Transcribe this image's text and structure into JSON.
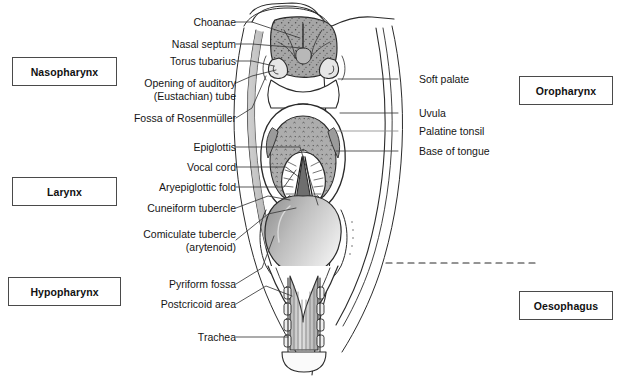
{
  "figure": {
    "colors": {
      "outline": "#2b2b2b",
      "mucosa_mid": "#9a9a9a",
      "mucosa_light": "#d9d9d9",
      "tongue_fill": "#b0b0b0",
      "epiglottis_fill": "#c8c8c8",
      "glottis_dark": "#6e6e6e",
      "trachea_fill": "#cfcfcf",
      "box_border": "#4a4a4a",
      "leader_line": "#3a3a3a",
      "background": "#ffffff"
    }
  },
  "region_boxes": [
    {
      "id": "nasopharynx",
      "label": "Nasopharynx",
      "side": "left"
    },
    {
      "id": "larynx",
      "label": "Larynx",
      "side": "left"
    },
    {
      "id": "hypopharynx",
      "label": "Hypopharynx",
      "side": "left"
    },
    {
      "id": "oropharynx",
      "label": "Oropharynx",
      "side": "right"
    },
    {
      "id": "oesophagus",
      "label": "Oesophagus",
      "side": "right"
    }
  ],
  "left_labels": [
    {
      "id": "choanae",
      "line1": "Choanae",
      "line2": ""
    },
    {
      "id": "nasal-septum",
      "line1": "Nasal septum",
      "line2": ""
    },
    {
      "id": "torus-tubarius",
      "line1": "Torus tubarius",
      "line2": ""
    },
    {
      "id": "auditory-tube",
      "line1": "Opening of auditory",
      "line2": "(Eustachian) tube"
    },
    {
      "id": "fossa-rosenmuller",
      "line1": "Fossa of Rosenmüller",
      "line2": ""
    },
    {
      "id": "epiglottis",
      "line1": "Epiglottis",
      "line2": ""
    },
    {
      "id": "vocal-cord",
      "line1": "Vocal cord",
      "line2": ""
    },
    {
      "id": "aryepiglottic-fold",
      "line1": "Aryepiglottic fold",
      "line2": ""
    },
    {
      "id": "cuneiform-tubercle",
      "line1": "Cuneiform tubercle",
      "line2": ""
    },
    {
      "id": "corniculate-tubercle",
      "line1": "Comiculate tubercle",
      "line2": "(arytenoid)"
    },
    {
      "id": "pyriform-fossa",
      "line1": "Pyriform fossa",
      "line2": ""
    },
    {
      "id": "postcricoid-area",
      "line1": "Postcricoid area",
      "line2": ""
    },
    {
      "id": "trachea",
      "line1": "Trachea",
      "line2": ""
    }
  ],
  "right_labels": [
    {
      "id": "soft-palate",
      "line1": "Soft palate"
    },
    {
      "id": "uvula",
      "line1": "Uvula"
    },
    {
      "id": "palatine-tonsil",
      "line1": "Palatine tonsil"
    },
    {
      "id": "base-of-tongue",
      "line1": "Base of tongue"
    }
  ]
}
